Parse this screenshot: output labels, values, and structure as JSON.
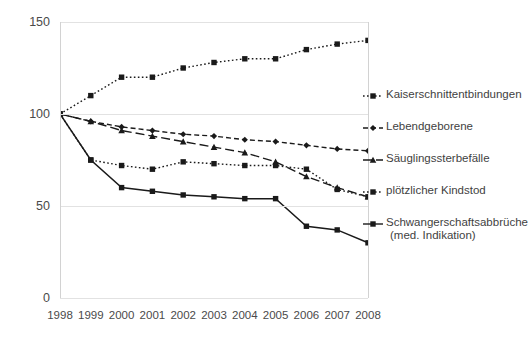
{
  "chart_data": {
    "type": "line",
    "title": "",
    "subtitle": "",
    "xlabel": "",
    "ylabel": "",
    "x": [
      1998,
      1999,
      2000,
      2001,
      2002,
      2003,
      2004,
      2005,
      2006,
      2007,
      2008
    ],
    "xtick_labels": [
      "1998",
      "1999",
      "2000",
      "2001",
      "2002",
      "2003",
      "2004",
      "2005",
      "2006",
      "2007",
      "2008"
    ],
    "ytick_labels": [
      "0",
      "50",
      "100",
      "150"
    ],
    "yticks": [
      0,
      50,
      100,
      150
    ],
    "ylim": [
      0,
      150
    ],
    "grid": true,
    "legend_position": "right",
    "series": [
      {
        "name": "Kaiserschnittentbindungen",
        "values": [
          100,
          110,
          120,
          120,
          125,
          128,
          130,
          130,
          135,
          138,
          140
        ],
        "line_style": "dotted",
        "marker": "square",
        "color": "#1a1a1a"
      },
      {
        "name": "Lebendgeborene",
        "values": [
          100,
          96,
          93,
          91,
          89,
          88,
          86,
          85,
          83,
          81,
          80
        ],
        "line_style": "dashed",
        "marker": "diamond",
        "color": "#1a1a1a"
      },
      {
        "name": "Säuglingssterbefälle",
        "values": [
          100,
          96,
          91,
          88,
          85,
          82,
          79,
          74,
          66,
          60,
          55
        ],
        "line_style": "long-dash",
        "marker": "triangle",
        "color": "#1a1a1a"
      },
      {
        "name": "plötzlicher Kindstod",
        "values": [
          100,
          75,
          72,
          70,
          74,
          73,
          72,
          72,
          70,
          59,
          55
        ],
        "line_style": "dotted",
        "marker": "square",
        "color": "#1a1a1a"
      },
      {
        "name": "Schwangerschaftsabbrüche (med. Indikation)",
        "name_line1": "Schwangerschaftsabbrüche",
        "name_line2": "(med. Indikation)",
        "values": [
          100,
          75,
          60,
          58,
          56,
          55,
          54,
          54,
          39,
          37,
          30
        ],
        "line_style": "solid",
        "marker": "square",
        "color": "#1a1a1a"
      }
    ]
  },
  "legend": {
    "items": [
      {
        "label": "Kaiserschnittentbindungen",
        "sub": ""
      },
      {
        "label": "Lebendgeborene",
        "sub": ""
      },
      {
        "label": "Säuglingssterbefälle",
        "sub": ""
      },
      {
        "label": "plötzlicher Kindstod",
        "sub": ""
      },
      {
        "label": "Schwangerschaftsabbrüche",
        "sub": "(med. Indikation)"
      }
    ]
  },
  "colors": {
    "ink": "#1a1a1a",
    "grid": "#e2e2e2",
    "axis": "#d2d2d2",
    "text": "#4a4a4a",
    "background": "#ffffff"
  }
}
